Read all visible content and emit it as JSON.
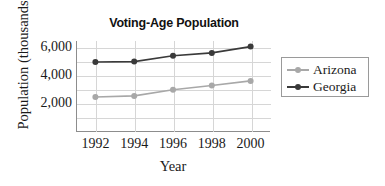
{
  "chart_data": {
    "type": "line",
    "title": "Voting-Age Population",
    "xlabel": "Year",
    "ylabel": "Population (thousands)",
    "categories": [
      "1992",
      "1994",
      "1996",
      "1998",
      "2000"
    ],
    "series": [
      {
        "name": "Arizona",
        "color": "#a8a8a8",
        "values": [
          2500,
          2580,
          3020,
          3320,
          3650
        ]
      },
      {
        "name": "Georgia",
        "color": "#3a3a3a",
        "values": [
          5000,
          5030,
          5450,
          5650,
          6100
        ]
      }
    ],
    "ylim": [
      0,
      6500
    ],
    "ytick_labels": [
      "2,000",
      "4,000",
      "6,000"
    ],
    "ytick_values": [
      2000,
      4000,
      6000
    ],
    "gridline_values": [
      1000,
      2000,
      3000,
      4000,
      5000,
      6000
    ],
    "grid": true,
    "legend_position": "right"
  },
  "legend": {
    "entries": [
      {
        "label": "Arizona"
      },
      {
        "label": "Georgia"
      }
    ]
  }
}
